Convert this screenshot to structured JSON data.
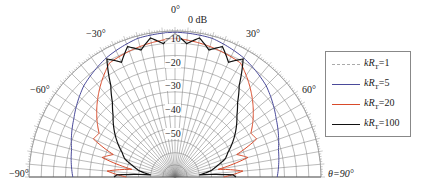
{
  "chart_data": {
    "type": "polar-line",
    "title": "",
    "angle_axis": {
      "label": "θ",
      "range_deg": [
        -90,
        90
      ],
      "tick_labels": [
        "−90°",
        "−60°",
        "−30°",
        "0°",
        "30°",
        "60°",
        "θ=90°"
      ],
      "tick_values": [
        -90,
        -60,
        -30,
        0,
        30,
        60,
        90
      ]
    },
    "radial_axis": {
      "unit": "dB",
      "range": [
        -60,
        0
      ],
      "tick_labels": [
        "0 dB",
        "−10",
        "−20",
        "−30",
        "−40",
        "−50"
      ],
      "tick_values": [
        0,
        -10,
        -20,
        -30,
        -40,
        -50
      ]
    },
    "grid": true,
    "legend_position": "right",
    "series": [
      {
        "name": "kR_T=1",
        "color": "#aaaaaa",
        "dash": "dashed",
        "theta_deg": [
          -90,
          -60,
          -30,
          0,
          30,
          60,
          90
        ],
        "r_db": [
          0,
          0,
          0,
          0,
          0,
          0,
          0
        ]
      },
      {
        "name": "kR_T=5",
        "color": "#4a4a9a",
        "dash": "solid",
        "theta_deg": [
          -90,
          -75,
          -60,
          -45,
          -30,
          -15,
          0,
          15,
          30,
          45,
          60,
          75,
          90
        ],
        "r_db": [
          -18,
          -16,
          -12,
          -7,
          -3.5,
          -1,
          -0.5,
          -1,
          -3.5,
          -7,
          -12,
          -16,
          -18
        ]
      },
      {
        "name": "kR_T=20",
        "color": "#d84a2a",
        "dash": "solid",
        "theta_deg": [
          -90,
          -85,
          -80,
          -75,
          -70,
          -65,
          -60,
          -50,
          -40,
          -30,
          -20,
          -10,
          0,
          10,
          20,
          30,
          40,
          50,
          60,
          65,
          70,
          75,
          80,
          85,
          90
        ],
        "r_db": [
          -40,
          -32,
          -42,
          -29,
          -33,
          -23,
          -24,
          -18,
          -12,
          -6,
          -5,
          -4,
          -3,
          -4,
          -5,
          -6,
          -12,
          -18,
          -24,
          -23,
          -33,
          -29,
          -42,
          -32,
          -40
        ]
      },
      {
        "name": "kR_T=100",
        "color": "#111111",
        "dash": "solid",
        "theta_deg": [
          -90,
          -88,
          -85,
          -80,
          -75,
          -70,
          -65,
          -60,
          -55,
          -50,
          -45,
          -40,
          -35,
          -30,
          -25,
          -20,
          -15,
          -10,
          -5,
          0,
          5,
          10,
          15,
          20,
          25,
          30,
          35,
          40,
          45,
          50,
          55,
          60,
          65,
          70,
          75,
          80,
          85,
          88,
          90
        ],
        "r_db": [
          -35,
          -36,
          -50,
          -45,
          -42,
          -38,
          -36,
          -33,
          -30,
          -27,
          -24,
          -20,
          -14,
          -4,
          -8,
          -3,
          -6,
          -2,
          -5,
          -1,
          -5,
          -2,
          -6,
          -3,
          -8,
          -4,
          -14,
          -20,
          -24,
          -27,
          -30,
          -33,
          -36,
          -38,
          -42,
          -45,
          -50,
          -36,
          -35
        ]
      }
    ]
  },
  "labels": {
    "angle_neg90": "−90°",
    "angle_neg60": "−60°",
    "angle_neg30": "−30°",
    "angle_0": "0°",
    "angle_30": "30°",
    "angle_60": "60°",
    "angle_90": "θ=90°",
    "r_0": "0 dB",
    "r_10": "−10",
    "r_20": "−20",
    "r_30": "−30",
    "r_40": "−40",
    "r_50": "−50"
  },
  "legend": {
    "items": [
      {
        "prefix": "kR",
        "sub": "T",
        "suffix": "=1",
        "color": "#aaaaaa",
        "style": "dashed"
      },
      {
        "prefix": "kR",
        "sub": "T",
        "suffix": "=5",
        "color": "#4a4a9a",
        "style": "solid"
      },
      {
        "prefix": "kR",
        "sub": "T",
        "suffix": "=20",
        "color": "#d84a2a",
        "style": "solid"
      },
      {
        "prefix": "kR",
        "sub": "T",
        "suffix": "=100",
        "color": "#111111",
        "style": "solid"
      }
    ]
  }
}
